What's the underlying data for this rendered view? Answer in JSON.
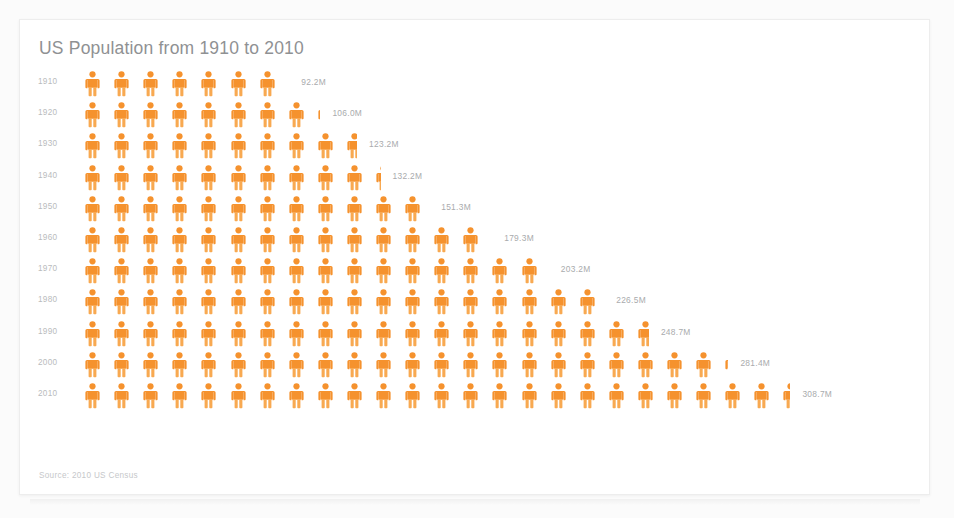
{
  "card": {
    "title": "US Population from 1910 to 2010",
    "source_note": "Source: 2010 US Census"
  },
  "colors": {
    "icon_orange": "#F5922E",
    "icon_orange_light": "#F8A951",
    "title_gray": "#8F9193",
    "label_gray": "#B9BBBD",
    "value_gray": "#A9ABAD",
    "card_background": "#FFFFFF",
    "card_border": "#EDEDED"
  },
  "chart_data": {
    "type": "pictogram",
    "title": "US Population from 1910 to 2010",
    "xlabel": "",
    "ylabel": "",
    "units": "millions",
    "icon_unit_value": 12.5,
    "icon_semantic": "person-icon",
    "legend": [],
    "grid": false,
    "categories": [
      "1910",
      "1920",
      "1930",
      "1940",
      "1950",
      "1960",
      "1970",
      "1980",
      "1990",
      "2000",
      "2010"
    ],
    "values": [
      92.2,
      106.0,
      123.2,
      132.2,
      151.3,
      179.3,
      203.2,
      226.5,
      248.7,
      281.4,
      308.7
    ],
    "value_labels": [
      "92.2M",
      "106.0M",
      "123.2M",
      "132.2M",
      "151.3M",
      "179.3M",
      "203.2M",
      "226.5M",
      "248.7M",
      "281.4M",
      "308.7M"
    ],
    "rows": [
      {
        "year": "1910",
        "value": 92.2,
        "label": "92.2M",
        "full_icons": 7,
        "partial": 0.38
      },
      {
        "year": "1920",
        "value": 106.0,
        "label": "106.0M",
        "full_icons": 8,
        "partial": 0.48
      },
      {
        "year": "1930",
        "value": 123.2,
        "label": "123.2M",
        "full_icons": 9,
        "partial": 0.86
      },
      {
        "year": "1940",
        "value": 132.2,
        "label": "132.2M",
        "full_icons": 10,
        "partial": 0.58
      },
      {
        "year": "1950",
        "value": 151.3,
        "label": "151.3M",
        "full_icons": 12,
        "partial": 0.1
      },
      {
        "year": "1960",
        "value": 179.3,
        "label": "179.3M",
        "full_icons": 14,
        "partial": 0.34
      },
      {
        "year": "1970",
        "value": 203.2,
        "label": "203.2M",
        "full_icons": 16,
        "partial": 0.26
      },
      {
        "year": "1980",
        "value": 226.5,
        "label": "226.5M",
        "full_icons": 18,
        "partial": 0.12
      },
      {
        "year": "1990",
        "value": 248.7,
        "label": "248.7M",
        "full_icons": 19,
        "partial": 0.9
      },
      {
        "year": "2000",
        "value": 281.4,
        "label": "281.4M",
        "full_icons": 22,
        "partial": 0.51
      },
      {
        "year": "2010",
        "value": 308.7,
        "label": "308.7M",
        "full_icons": 24,
        "partial": 0.7
      }
    ]
  }
}
